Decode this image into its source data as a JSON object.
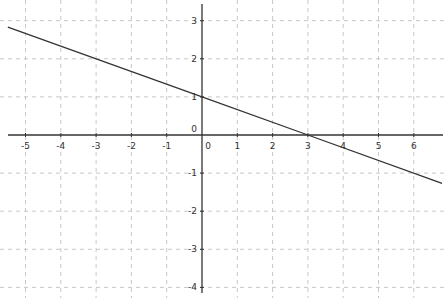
{
  "chart_data": {
    "type": "line",
    "title": "",
    "xlabel": "",
    "ylabel": "",
    "xlim": [
      -5.6,
      6.8
    ],
    "ylim": [
      -4.1,
      3.5
    ],
    "grid": true,
    "grid_style": "dashed",
    "x_ticks": [
      -5,
      -4,
      -3,
      -2,
      -1,
      0,
      1,
      2,
      3,
      4,
      5,
      6
    ],
    "y_ticks": [
      -4,
      -3,
      -2,
      -1,
      0,
      1,
      2,
      3
    ],
    "series": [
      {
        "name": "y = -x/3 + 1",
        "equation": "y = -1/3 x + 1",
        "x": [
          -5.5,
          0,
          3,
          6.8
        ],
        "y": [
          2.833,
          1,
          0,
          -1.267
        ],
        "color": "#333333"
      }
    ],
    "annotations": []
  },
  "colors": {
    "background": "#ffffff",
    "axis": "#333333",
    "grid": "#c8c8c8",
    "line": "#333333"
  }
}
